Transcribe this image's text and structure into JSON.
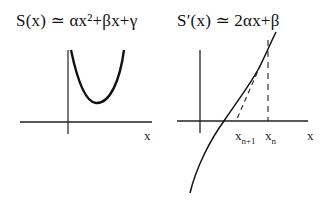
{
  "left_panel": {
    "equation": "S(x)  ≃  αx²+βx+γ",
    "x_axis_label": "x",
    "curve": "parabola"
  },
  "right_panel": {
    "equation": "S′(x)  ≃  2αx+β",
    "x_axis_label": "x",
    "labels": {
      "x_n_plus_1": {
        "base": "x",
        "sub": "n+1"
      },
      "x_n": {
        "base": "x",
        "sub": "n"
      }
    },
    "curve": "derivative with secant/tangent construction"
  },
  "colors": {
    "ink": "#111111",
    "background": "#ffffff"
  }
}
